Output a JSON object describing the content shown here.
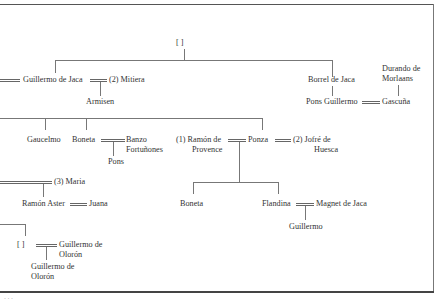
{
  "diagram": {
    "type": "genealogy-tree",
    "nodes": {
      "root": "[ ]",
      "guillermo_de_jaca": "Guillermo de Jaca",
      "mitiera": "(2) Mitiera",
      "armisen": "Armisen",
      "borrel_de_jaca": "Borrel de Jaca",
      "durando_1": "Durando de",
      "durando_2": "Morlaans",
      "pons_guillermo": "Pons Guillermo",
      "gascuna": "Gascuña",
      "gaucelmo": "Gaucelmo",
      "boneta_1": "Boneta",
      "banzo_1": "Banzo",
      "banzo_2": "Fortuñones",
      "pons": "Pons",
      "ramon_provence_1": "(1) Ramón de",
      "ramon_provence_2": "Provence",
      "ponza": "Ponza",
      "jofre_1": "(2) Jofré de",
      "jofre_2": "Huesca",
      "maria": "(3) Maria",
      "ramon_aster": "Ramón Aster",
      "juana": "Juana",
      "boneta_2": "Boneta",
      "flandina": "Flandina",
      "magnet_de_jaca": "Magnet de Jaca",
      "guillermo": "Guillermo",
      "unknown_2": "[ ]",
      "guillermo_oloron_a1": "Guillermo de",
      "guillermo_oloron_a2": "Olorón",
      "guillermo_oloron_b1": "Guillermo de",
      "guillermo_oloron_b2": "Olorón"
    },
    "footer": "· · ·"
  }
}
